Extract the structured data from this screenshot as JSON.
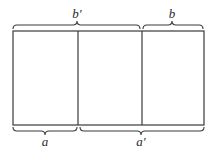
{
  "diagram": {
    "rectangle": {
      "x": 13,
      "y": 31,
      "width": 191,
      "height": 94
    },
    "dividers_x": [
      78,
      142
    ],
    "top_braces": [
      {
        "label": "b′",
        "x1": 13,
        "x2": 140,
        "y": 25
      },
      {
        "label": "b",
        "x1": 143,
        "x2": 203,
        "y": 25
      }
    ],
    "bottom_braces": [
      {
        "label": "a",
        "x1": 13,
        "x2": 77,
        "y": 131
      },
      {
        "label": "a′",
        "x1": 80,
        "x2": 204,
        "y": 131
      }
    ],
    "colors": {
      "line": "#3a3a3a",
      "text": "#2a2a2a",
      "background": "#ffffff"
    }
  }
}
